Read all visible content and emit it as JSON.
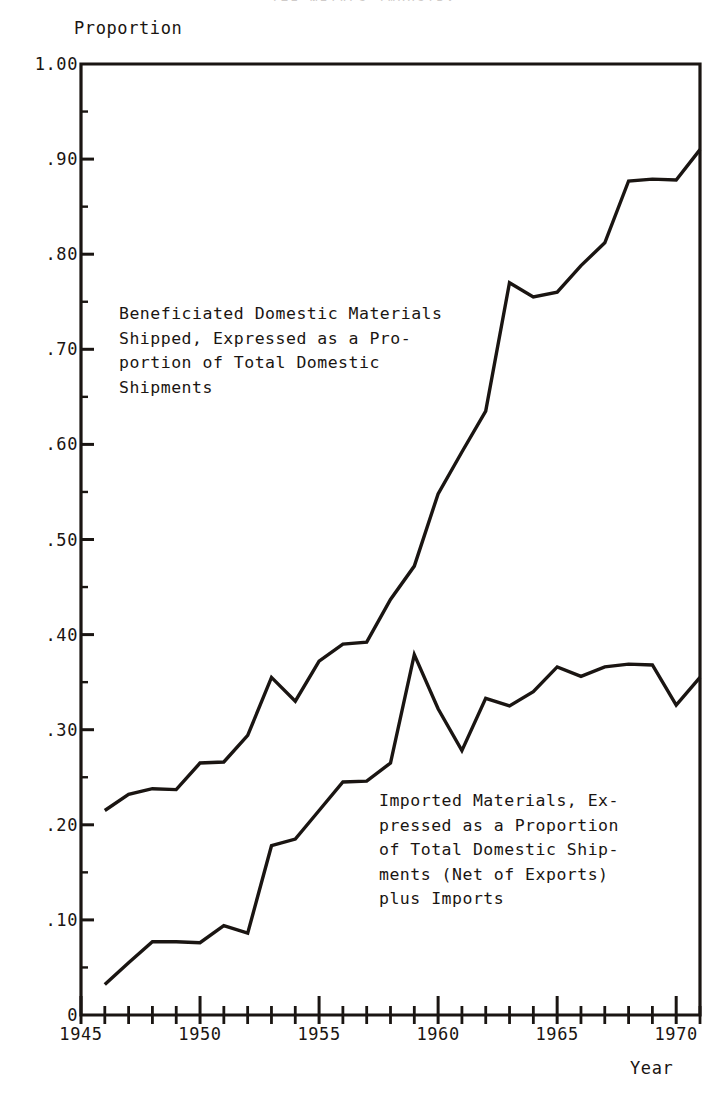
{
  "figure": {
    "cut_off_title": "THE  METALS  INDUSTRY",
    "y_axis_caption": "Proportion",
    "x_axis_caption": "Year"
  },
  "annotations": {
    "upper_series_note": "Beneficiated Domestic Materials\nShipped, Expressed as a Pro-\nportion of Total Domestic\nShipments",
    "lower_series_note": "Imported Materials, Ex-\npressed as a Proportion\nof Total Domestic Ship-\nments (Net of Exports)\nplus Imports"
  },
  "chart_data": {
    "type": "line",
    "title": "",
    "xlabel": "Year",
    "ylabel": "Proportion",
    "xlim": [
      1945,
      1971
    ],
    "ylim": [
      0.0,
      1.0
    ],
    "grid": false,
    "legend": "none (series labelled by inline annotations)",
    "y_ticks": [
      {
        "value": 1.0,
        "label": "1.00"
      },
      {
        "value": 0.9,
        "label": ".90"
      },
      {
        "value": 0.8,
        "label": ".80"
      },
      {
        "value": 0.7,
        "label": ".70"
      },
      {
        "value": 0.6,
        "label": ".60"
      },
      {
        "value": 0.5,
        "label": ".50"
      },
      {
        "value": 0.4,
        "label": ".40"
      },
      {
        "value": 0.3,
        "label": ".30"
      },
      {
        "value": 0.2,
        "label": ".20"
      },
      {
        "value": 0.1,
        "label": ".10"
      },
      {
        "value": 0.0,
        "label": "0"
      }
    ],
    "y_minor_ticks": [
      0.95,
      0.85,
      0.75,
      0.65,
      0.55,
      0.45,
      0.35,
      0.25,
      0.15,
      0.05
    ],
    "x_ticks_major": [
      {
        "value": 1945,
        "label": "1945"
      },
      {
        "value": 1950,
        "label": "1950"
      },
      {
        "value": 1955,
        "label": "1955"
      },
      {
        "value": 1960,
        "label": "1960"
      },
      {
        "value": 1965,
        "label": "1965"
      },
      {
        "value": 1970,
        "label": "1970"
      }
    ],
    "x_ticks_minor": [
      1946,
      1947,
      1948,
      1949,
      1951,
      1952,
      1953,
      1954,
      1956,
      1957,
      1958,
      1959,
      1961,
      1962,
      1963,
      1964,
      1966,
      1967,
      1968,
      1969,
      1971
    ],
    "line_color": "#1a1512",
    "line_width": 3.4,
    "series": [
      {
        "name": "Beneficiated Domestic Materials Shipped, Expressed as a Proportion of Total Domestic Shipments",
        "x": [
          1946,
          1947,
          1948,
          1949,
          1950,
          1951,
          1952,
          1953,
          1954,
          1955,
          1956,
          1957,
          1958,
          1959,
          1960,
          1961,
          1962,
          1963,
          1964,
          1965,
          1966,
          1967,
          1968,
          1969,
          1970,
          1971
        ],
        "values": [
          0.215,
          0.232,
          0.238,
          0.237,
          0.265,
          0.266,
          0.294,
          0.355,
          0.33,
          0.372,
          0.39,
          0.392,
          0.437,
          0.472,
          0.548,
          0.592,
          0.635,
          0.77,
          0.755,
          0.76,
          0.788,
          0.812,
          0.877,
          0.879,
          0.878,
          0.91
        ]
      },
      {
        "name": "Imported Materials, Expressed as a Proportion of Total Domestic Shipments (Net of Exports) plus Imports",
        "x": [
          1946,
          1947,
          1948,
          1949,
          1950,
          1951,
          1952,
          1953,
          1954,
          1955,
          1956,
          1957,
          1958,
          1959,
          1960,
          1961,
          1962,
          1963,
          1964,
          1965,
          1966,
          1967,
          1968,
          1969,
          1970,
          1971
        ],
        "values": [
          0.032,
          0.055,
          0.077,
          0.077,
          0.076,
          0.094,
          0.086,
          0.178,
          0.185,
          0.215,
          0.245,
          0.246,
          0.265,
          0.379,
          0.322,
          0.278,
          0.333,
          0.325,
          0.34,
          0.366,
          0.356,
          0.366,
          0.369,
          0.368,
          0.326,
          0.355
        ]
      }
    ]
  }
}
